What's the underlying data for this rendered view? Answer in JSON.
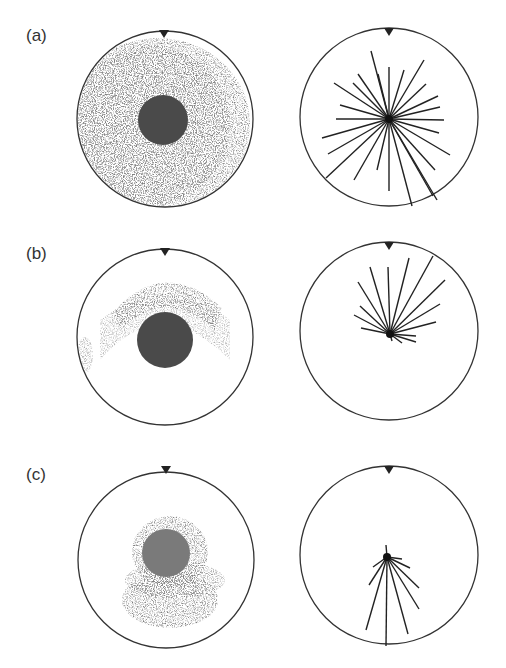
{
  "figure": {
    "panels": [
      {
        "label": "(a)",
        "label_pos": [
          26,
          36
        ],
        "photo": {
          "cx": 165,
          "cy": 119,
          "r": 88,
          "core_cx": 163,
          "core_cy": 120,
          "core_r": 25,
          "spread": "full radial, heavier on left"
        },
        "diagram": {
          "cx": 389,
          "cy": 117,
          "r": 89,
          "center": [
            389,
            119
          ],
          "rays": [
            [
              371,
              51
            ],
            [
              389,
              67
            ],
            [
              404,
              70
            ],
            [
              424,
              60
            ],
            [
              358,
              74
            ],
            [
              378,
              74
            ],
            [
              353,
              83
            ],
            [
              426,
              84
            ],
            [
              334,
              83
            ],
            [
              438,
              96
            ],
            [
              340,
              105
            ],
            [
              440,
              107
            ],
            [
              336,
              119
            ],
            [
              444,
              120
            ],
            [
              322,
              138
            ],
            [
              439,
              133
            ],
            [
              328,
              154
            ],
            [
              450,
              155
            ],
            [
              326,
              178
            ],
            [
              435,
              170
            ],
            [
              354,
              180
            ],
            [
              377,
              170
            ],
            [
              389,
              191
            ],
            [
              412,
              206
            ],
            [
              433,
              196
            ],
            [
              437,
              200
            ]
          ]
        }
      },
      {
        "label": "(b)",
        "label_pos": [
          26,
          254
        ],
        "photo": {
          "cx": 165,
          "cy": 337,
          "r": 88,
          "core_cx": 165,
          "core_cy": 340,
          "core_r": 28,
          "spread": "upper arc"
        },
        "diagram": {
          "cx": 389,
          "cy": 331,
          "r": 89,
          "center": [
            390,
            334
          ],
          "rays": [
            [
              370,
              267
            ],
            [
              388,
              267
            ],
            [
              409,
              258
            ],
            [
              433,
              256
            ],
            [
              358,
              282
            ],
            [
              445,
              280
            ],
            [
              360,
              306
            ],
            [
              440,
              304
            ],
            [
              354,
              315
            ],
            [
              436,
              322
            ],
            [
              361,
              328
            ],
            [
              416,
              336
            ],
            [
              416,
              342
            ],
            [
              402,
              343
            ],
            [
              392,
              341
            ]
          ]
        }
      },
      {
        "label": "(c)",
        "label_pos": [
          26,
          475
        ],
        "photo": {
          "cx": 166,
          "cy": 560,
          "r": 88,
          "core_cx": 166,
          "core_cy": 553,
          "core_r": 24,
          "spread": "lower cluster"
        },
        "diagram": {
          "cx": 389,
          "cy": 555,
          "r": 89,
          "center": [
            387,
            557
          ],
          "rays": [
            [
              386,
              545
            ],
            [
              373,
              567
            ],
            [
              369,
              585
            ],
            [
              366,
              630
            ],
            [
              386,
              646
            ],
            [
              408,
              634
            ],
            [
              419,
              609
            ],
            [
              419,
              588
            ],
            [
              410,
              568
            ],
            [
              402,
              559
            ]
          ]
        }
      }
    ],
    "marker": "triangle-down at top of every circle"
  }
}
